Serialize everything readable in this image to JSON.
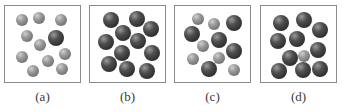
{
  "figure": {
    "panels": [
      {
        "id": "a",
        "label": "(a)",
        "left": 4,
        "balls": [
          {
            "type": "small",
            "x": 17,
            "y": 14
          },
          {
            "type": "small",
            "x": 34,
            "y": 12
          },
          {
            "type": "small",
            "x": 56,
            "y": 14
          },
          {
            "type": "small",
            "x": 22,
            "y": 30
          },
          {
            "type": "large",
            "x": 51,
            "y": 32
          },
          {
            "type": "small",
            "x": 35,
            "y": 39
          },
          {
            "type": "small",
            "x": 17,
            "y": 51
          },
          {
            "type": "small",
            "x": 60,
            "y": 48
          },
          {
            "type": "small",
            "x": 43,
            "y": 55
          },
          {
            "type": "small",
            "x": 28,
            "y": 65
          },
          {
            "type": "small",
            "x": 57,
            "y": 63
          }
        ]
      },
      {
        "id": "b",
        "label": "(b)",
        "left": 89,
        "balls": [
          {
            "type": "large",
            "x": 21,
            "y": 14
          },
          {
            "type": "large",
            "x": 47,
            "y": 13
          },
          {
            "type": "large",
            "x": 61,
            "y": 23
          },
          {
            "type": "large",
            "x": 33,
            "y": 27
          },
          {
            "type": "large",
            "x": 48,
            "y": 35
          },
          {
            "type": "large",
            "x": 16,
            "y": 36
          },
          {
            "type": "large",
            "x": 32,
            "y": 47
          },
          {
            "type": "large",
            "x": 62,
            "y": 47
          },
          {
            "type": "large",
            "x": 19,
            "y": 58
          },
          {
            "type": "large",
            "x": 37,
            "y": 63
          },
          {
            "type": "large",
            "x": 57,
            "y": 65
          }
        ]
      },
      {
        "id": "c",
        "label": "(c)",
        "left": 174,
        "balls": [
          {
            "type": "small",
            "x": 23,
            "y": 13
          },
          {
            "type": "small",
            "x": 39,
            "y": 18
          },
          {
            "type": "large",
            "x": 59,
            "y": 17
          },
          {
            "type": "large",
            "x": 17,
            "y": 28
          },
          {
            "type": "large",
            "x": 44,
            "y": 34
          },
          {
            "type": "small",
            "x": 28,
            "y": 40
          },
          {
            "type": "large",
            "x": 59,
            "y": 45
          },
          {
            "type": "small",
            "x": 18,
            "y": 53
          },
          {
            "type": "small",
            "x": 44,
            "y": 52
          },
          {
            "type": "large",
            "x": 34,
            "y": 63
          },
          {
            "type": "small",
            "x": 59,
            "y": 64
          }
        ]
      },
      {
        "id": "d",
        "label": "(d)",
        "left": 260,
        "balls": [
          {
            "type": "large",
            "x": 20,
            "y": 17
          },
          {
            "type": "large",
            "x": 43,
            "y": 14
          },
          {
            "type": "large",
            "x": 59,
            "y": 24
          },
          {
            "type": "large",
            "x": 17,
            "y": 35
          },
          {
            "type": "large",
            "x": 36,
            "y": 33
          },
          {
            "type": "large",
            "x": 29,
            "y": 52
          },
          {
            "type": "small",
            "x": 43,
            "y": 50
          },
          {
            "type": "large",
            "x": 57,
            "y": 44
          },
          {
            "type": "large",
            "x": 18,
            "y": 65
          },
          {
            "type": "large",
            "x": 42,
            "y": 64
          },
          {
            "type": "large",
            "x": 59,
            "y": 63
          }
        ]
      }
    ],
    "colors": {
      "border": "#8a8a8a",
      "small_ball": "#8a8a8a",
      "large_ball": "#3a3a3a",
      "label": "#3a3a3a"
    }
  }
}
